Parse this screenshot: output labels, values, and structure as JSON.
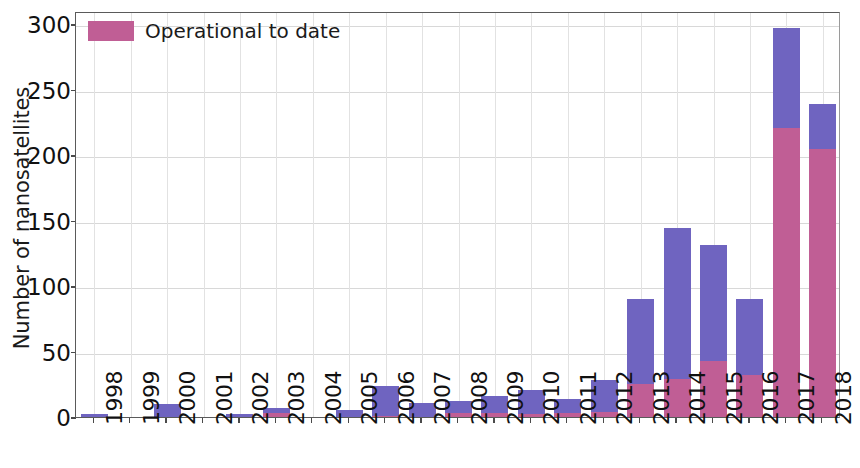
{
  "chart_data": {
    "type": "bar",
    "subtype": "stacked-bar",
    "title": "",
    "xlabel": "",
    "ylabel": "Number of nanosatellites",
    "ylim": [
      0,
      310
    ],
    "yticks": [
      0,
      50,
      100,
      150,
      200,
      250,
      300
    ],
    "ytick_labels": [
      "0",
      "50",
      "100",
      "150",
      "200",
      "250",
      "300"
    ],
    "grid": true,
    "legend_position": "upper-left",
    "legend": [
      "Operational to date"
    ],
    "colors": {
      "total": "#6f64c0",
      "operational": "#c05e95",
      "axis": "#4a4a4a",
      "grid": "#d8d8d8",
      "text": "#111111"
    },
    "categories": [
      "1998",
      "1999",
      "2000",
      "2001",
      "2002",
      "2003",
      "2004",
      "2005",
      "2006",
      "2007",
      "2008",
      "2009",
      "2010",
      "2011",
      "2012",
      "2013",
      "2014",
      "2015",
      "2016",
      "2017",
      "2018"
    ],
    "series": [
      {
        "name": "Total launched",
        "color": "#6f64c0",
        "values": [
          2,
          0,
          10,
          0,
          2,
          7,
          0,
          5,
          24,
          11,
          12,
          16,
          21,
          14,
          28,
          90,
          144,
          131,
          90,
          297,
          239
        ]
      },
      {
        "name": "Operational to date",
        "color": "#c05e95",
        "values": [
          0,
          0,
          0,
          0,
          0,
          3,
          0,
          0,
          1,
          0,
          3,
          3,
          2,
          3,
          4,
          25,
          29,
          43,
          32,
          221,
          205
        ]
      }
    ]
  },
  "axis": {
    "ylabel": "Number of nanosatellites"
  },
  "legend": {
    "entries": [
      {
        "label": "Operational to date",
        "color": "#c05e95"
      }
    ]
  }
}
